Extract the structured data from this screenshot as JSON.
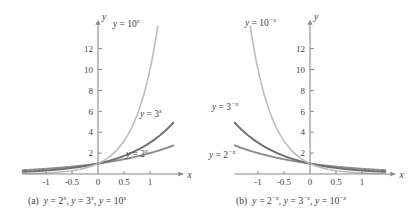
{
  "figure": {
    "title": "",
    "panels": [
      {
        "id": "a",
        "caption_prefix": "(a)",
        "caption_full": "(a) y = 2^x, y = 3^x, y = 10^x",
        "axis": {
          "x_label": "x",
          "y_label": "y",
          "x_ticks": [
            "-1",
            "-0.5",
            "0",
            "0.5",
            "1"
          ],
          "x_tick_values": [
            -1,
            -0.5,
            0,
            0.5,
            1
          ],
          "y_ticks": [
            "2",
            "4",
            "6",
            "8",
            "10",
            "12"
          ],
          "y_tick_values": [
            2,
            4,
            6,
            8,
            10,
            12
          ],
          "xlim": [
            -1.45,
            1.45
          ],
          "ylim": [
            0,
            14
          ]
        },
        "curves": [
          {
            "label": "y = 2",
            "exponent": "x",
            "base": 2,
            "sign": 1,
            "color": "#8c8c8c",
            "label_x": 126,
            "label_y": 157
          },
          {
            "label": "y = 3",
            "exponent": "x",
            "base": 3,
            "sign": 1,
            "color": "#6e6e6e",
            "label_x": 140,
            "label_y": 117
          },
          {
            "label": "y = 10",
            "exponent": "x",
            "base": 10,
            "sign": 1,
            "color": "#bdbdbd",
            "label_x": 113,
            "label_y": 27
          }
        ]
      },
      {
        "id": "b",
        "caption_prefix": "(b)",
        "caption_full": "(b) y = 2^-x, y = 3^-x, y = 10^-x",
        "axis": {
          "x_label": "x",
          "y_label": "y",
          "x_ticks": [
            "-1",
            "-0.5",
            "0",
            "0.5",
            "1"
          ],
          "x_tick_values": [
            -1,
            -0.5,
            0,
            0.5,
            1
          ],
          "y_ticks": [
            "2",
            "4",
            "6",
            "8",
            "10",
            "12"
          ],
          "y_tick_values": [
            2,
            4,
            6,
            8,
            10,
            12
          ],
          "xlim": [
            -1.45,
            1.45
          ],
          "ylim": [
            0,
            14
          ]
        },
        "curves": [
          {
            "label": "y = 2",
            "exponent": "-x",
            "base": 2,
            "sign": -1,
            "color": "#8c8c8c",
            "label_x": 209,
            "label_y": 158
          },
          {
            "label": "y = 3",
            "exponent": "-x",
            "base": 3,
            "sign": -1,
            "color": "#6e6e6e",
            "label_x": 212,
            "label_y": 110
          },
          {
            "label": "y = 10",
            "exponent": "-x",
            "base": 10,
            "sign": -1,
            "color": "#bdbdbd",
            "label_x": 245,
            "label_y": 26
          }
        ]
      }
    ],
    "colors": {
      "axis": "#8a8a8a",
      "text": "#3f3f3f",
      "curve_2": "#8c8c8c",
      "curve_3": "#6e6e6e",
      "curve_10": "#bdbdbd",
      "background": "#ffffff"
    }
  },
  "chart_data": {
    "type": "line",
    "xlabel": "x",
    "ylabel": "y",
    "grid": false,
    "legend": "inline-curve-labels",
    "xlim": [
      -1.45,
      1.45
    ],
    "ylim": [
      0,
      14
    ],
    "x_ticks": [
      -1,
      -0.5,
      0,
      0.5,
      1
    ],
    "y_ticks": [
      2,
      4,
      6,
      8,
      10,
      12
    ],
    "x": [
      -1.4,
      -1.2,
      -1.0,
      -0.8,
      -0.6,
      -0.4,
      -0.2,
      0.0,
      0.2,
      0.4,
      0.6,
      0.8,
      1.0,
      1.2,
      1.4
    ],
    "panels": [
      {
        "name": "(a) y = 2^x, y = 3^x, y = 10^x",
        "series": [
          {
            "name": "y = 2^x",
            "values": [
              0.379,
              0.435,
              0.5,
              0.574,
              0.66,
              0.758,
              0.871,
              1.0,
              1.149,
              1.32,
              1.516,
              1.741,
              2.0,
              2.297,
              2.639
            ]
          },
          {
            "name": "y = 3^x",
            "values": [
              0.239,
              0.292,
              0.333,
              0.415,
              0.517,
              0.644,
              0.803,
              1.0,
              1.246,
              1.552,
              1.933,
              2.408,
              3.0,
              3.737,
              4.656
            ]
          },
          {
            "name": "y = 10^x",
            "values": [
              0.04,
              0.063,
              0.1,
              0.158,
              0.251,
              0.398,
              0.631,
              1.0,
              1.585,
              2.512,
              3.981,
              6.31,
              10.0,
              15.849,
              25.119
            ]
          }
        ]
      },
      {
        "name": "(b) y = 2^-x, y = 3^-x, y = 10^-x",
        "series": [
          {
            "name": "y = 2^-x",
            "values": [
              2.639,
              2.297,
              2.0,
              1.741,
              1.516,
              1.32,
              1.149,
              1.0,
              0.871,
              0.758,
              0.66,
              0.574,
              0.5,
              0.435,
              0.379
            ]
          },
          {
            "name": "y = 3^-x",
            "values": [
              4.656,
              3.737,
              3.0,
              2.408,
              1.933,
              1.552,
              1.246,
              1.0,
              0.803,
              0.644,
              0.517,
              0.415,
              0.333,
              0.292,
              0.239
            ]
          },
          {
            "name": "y = 10^-x",
            "values": [
              25.119,
              15.849,
              10.0,
              6.31,
              3.981,
              2.512,
              1.585,
              1.0,
              0.631,
              0.398,
              0.251,
              0.158,
              0.1,
              0.063,
              0.04
            ]
          }
        ]
      }
    ]
  }
}
